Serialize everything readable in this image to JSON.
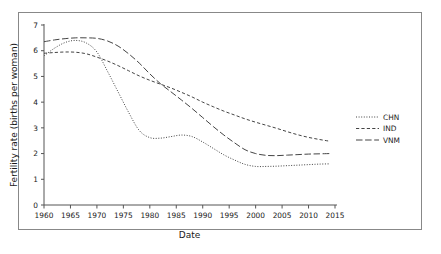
{
  "chart_data": {
    "type": "line",
    "title": "",
    "xlabel": "Date",
    "ylabel": "Fertility rate (births per woman)",
    "xlim": [
      1960,
      2015
    ],
    "ylim": [
      0,
      7
    ],
    "xticks": [
      1960,
      1965,
      1970,
      1975,
      1980,
      1985,
      1990,
      1995,
      2000,
      2005,
      2010,
      2015
    ],
    "yticks": [
      0,
      1,
      2,
      3,
      4,
      5,
      6,
      7
    ],
    "grid": false,
    "legend_position": "right-outside",
    "x": [
      1960,
      1962,
      1964,
      1966,
      1968,
      1970,
      1972,
      1974,
      1976,
      1978,
      1980,
      1982,
      1984,
      1986,
      1988,
      1990,
      1992,
      1994,
      1996,
      1998,
      2000,
      2002,
      2004,
      2006,
      2008,
      2010,
      2012,
      2014
    ],
    "series": [
      {
        "name": "CHN",
        "linestyle": "dotted",
        "color": "#3a3a3a",
        "values": [
          5.8,
          6.1,
          6.32,
          6.4,
          6.3,
          5.95,
          5.2,
          4.4,
          3.6,
          2.9,
          2.62,
          2.6,
          2.66,
          2.72,
          2.66,
          2.45,
          2.2,
          1.95,
          1.75,
          1.58,
          1.5,
          1.5,
          1.51,
          1.53,
          1.55,
          1.57,
          1.59,
          1.6
        ]
      },
      {
        "name": "IND",
        "linestyle": "dashed",
        "color": "#3a3a3a",
        "values": [
          5.9,
          5.93,
          5.95,
          5.94,
          5.88,
          5.75,
          5.6,
          5.42,
          5.22,
          5.02,
          4.85,
          4.7,
          4.55,
          4.38,
          4.2,
          4.0,
          3.82,
          3.65,
          3.5,
          3.35,
          3.22,
          3.1,
          2.98,
          2.85,
          2.73,
          2.63,
          2.55,
          2.48
        ]
      },
      {
        "name": "VNM",
        "linestyle": "long-dashed",
        "color": "#3a3a3a",
        "values": [
          6.35,
          6.42,
          6.47,
          6.5,
          6.5,
          6.48,
          6.38,
          6.18,
          5.88,
          5.52,
          5.1,
          4.72,
          4.4,
          4.08,
          3.75,
          3.4,
          3.05,
          2.72,
          2.42,
          2.15,
          2.0,
          1.93,
          1.92,
          1.94,
          1.96,
          1.98,
          1.99,
          2.0
        ]
      }
    ]
  },
  "legend": {
    "entries": [
      {
        "label": "CHN"
      },
      {
        "label": "IND"
      },
      {
        "label": "VNM"
      }
    ]
  }
}
